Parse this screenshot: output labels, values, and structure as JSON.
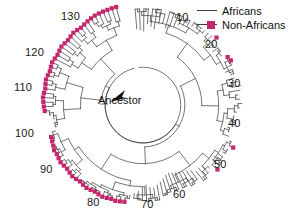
{
  "figure": {
    "type": "radial-phylogenetic-tree",
    "background_color": "#ffffff",
    "branch_color": "#3a3a3a",
    "accent_color": "#c2276b",
    "center_label": "Ancestor"
  },
  "legend": {
    "position": "top-right",
    "items": [
      {
        "label": "Africans",
        "marker": "line",
        "color": "#3a3a3a"
      },
      {
        "label": "Non-Africans",
        "marker": "line-with-square",
        "color": "#c2276b"
      }
    ]
  },
  "axis": {
    "kind": "radial-tip-index",
    "labels": [
      "10",
      "20",
      "30",
      "40",
      "50",
      "60",
      "70",
      "80",
      "90",
      "100",
      "110",
      "120",
      "130"
    ],
    "tip_count": 135,
    "label_positions": [
      {
        "value": "10",
        "x": 176,
        "y": 12
      },
      {
        "value": "20",
        "x": 205,
        "y": 39
      },
      {
        "value": "30",
        "x": 228,
        "y": 78
      },
      {
        "value": "40",
        "x": 228,
        "y": 118
      },
      {
        "value": "50",
        "x": 214,
        "y": 159
      },
      {
        "value": "60",
        "x": 173,
        "y": 189
      },
      {
        "value": "70",
        "x": 141,
        "y": 199
      },
      {
        "value": "80",
        "x": 87,
        "y": 197
      },
      {
        "value": "90",
        "x": 40,
        "y": 164
      },
      {
        "value": "100",
        "x": 15,
        "y": 128
      },
      {
        "value": "110",
        "x": 14,
        "y": 82
      },
      {
        "value": "120",
        "x": 25,
        "y": 47
      },
      {
        "value": "130",
        "x": 61,
        "y": 11
      }
    ]
  },
  "chart_data": {
    "type": "tree",
    "title": "",
    "subtitle": "",
    "xlabel": "",
    "ylabel": "",
    "legend_position": "top-right",
    "grid": false,
    "center": {
      "cx": 143,
      "cy": 105,
      "label": "Ancestor"
    },
    "radial_layout": {
      "inner_radius": 38,
      "outer_radius": 100,
      "start_angle_deg": -96,
      "sweep_deg": 352,
      "direction": "clockwise"
    },
    "series": [
      {
        "name": "Africans",
        "color": "#3a3a3a",
        "marker": "none",
        "tip_count": 106
      },
      {
        "name": "Non-Africans",
        "color": "#c2276b",
        "marker": "square",
        "tip_count": 29
      }
    ],
    "tips": [
      {
        "index": 1,
        "group": "Africans",
        "depth": 0.62
      },
      {
        "index": 2,
        "group": "Africans",
        "depth": 0.6
      },
      {
        "index": 3,
        "group": "Africans",
        "depth": 0.58
      },
      {
        "index": 4,
        "group": "Africans",
        "depth": 0.7
      },
      {
        "index": 5,
        "group": "Africans",
        "depth": 0.66
      },
      {
        "index": 6,
        "group": "Africans",
        "depth": 0.63
      },
      {
        "index": 7,
        "group": "Africans",
        "depth": 0.72
      },
      {
        "index": 8,
        "group": "Africans",
        "depth": 0.74
      },
      {
        "index": 9,
        "group": "Africans",
        "depth": 0.68
      },
      {
        "index": 10,
        "group": "Africans",
        "depth": 0.71
      },
      {
        "index": 11,
        "group": "Africans",
        "depth": 0.75
      },
      {
        "index": 12,
        "group": "Africans",
        "depth": 0.8
      },
      {
        "index": 13,
        "group": "Africans",
        "depth": 0.83
      },
      {
        "index": 14,
        "group": "Africans",
        "depth": 0.85
      },
      {
        "index": 15,
        "group": "Africans",
        "depth": 0.88
      },
      {
        "index": 16,
        "group": "Africans",
        "depth": 0.9
      },
      {
        "index": 17,
        "group": "Africans",
        "depth": 0.92
      },
      {
        "index": 18,
        "group": "Africans",
        "depth": 0.94
      },
      {
        "index": 19,
        "group": "Africans",
        "depth": 0.95
      },
      {
        "index": 20,
        "group": "Africans",
        "depth": 0.96
      },
      {
        "index": 21,
        "group": "Non-Africans",
        "depth": 0.97
      },
      {
        "index": 22,
        "group": "Africans",
        "depth": 0.84
      },
      {
        "index": 23,
        "group": "Africans",
        "depth": 0.8
      },
      {
        "index": 24,
        "group": "Africans",
        "depth": 0.86
      },
      {
        "index": 25,
        "group": "Africans",
        "depth": 0.88
      },
      {
        "index": 26,
        "group": "Non-Africans",
        "depth": 0.93
      },
      {
        "index": 27,
        "group": "Non-Africans",
        "depth": 0.95
      },
      {
        "index": 28,
        "group": "Africans",
        "depth": 0.9
      },
      {
        "index": 29,
        "group": "Africans",
        "depth": 0.82
      },
      {
        "index": 30,
        "group": "Africans",
        "depth": 0.88
      },
      {
        "index": 31,
        "group": "Africans",
        "depth": 0.92
      },
      {
        "index": 32,
        "group": "Africans",
        "depth": 0.96
      },
      {
        "index": 33,
        "group": "Africans",
        "depth": 0.99
      },
      {
        "index": 34,
        "group": "Africans",
        "depth": 0.97
      },
      {
        "index": 35,
        "group": "Africans",
        "depth": 0.93
      },
      {
        "index": 36,
        "group": "Africans",
        "depth": 0.95
      },
      {
        "index": 37,
        "group": "Africans",
        "depth": 0.98
      },
      {
        "index": 38,
        "group": "Africans",
        "depth": 0.94
      },
      {
        "index": 39,
        "group": "Africans",
        "depth": 0.9
      },
      {
        "index": 40,
        "group": "Africans",
        "depth": 0.86
      },
      {
        "index": 41,
        "group": "Africans",
        "depth": 0.88
      },
      {
        "index": 42,
        "group": "Africans",
        "depth": 0.84
      },
      {
        "index": 43,
        "group": "Africans",
        "depth": 0.8
      },
      {
        "index": 44,
        "group": "Africans",
        "depth": 0.83
      },
      {
        "index": 45,
        "group": "Africans",
        "depth": 0.86
      },
      {
        "index": 46,
        "group": "Africans",
        "depth": 0.9
      },
      {
        "index": 47,
        "group": "Non-Africans",
        "depth": 0.97
      },
      {
        "index": 48,
        "group": "Africans",
        "depth": 0.92
      },
      {
        "index": 49,
        "group": "Africans",
        "depth": 0.88
      },
      {
        "index": 50,
        "group": "Africans",
        "depth": 0.84
      },
      {
        "index": 51,
        "group": "Africans",
        "depth": 0.8
      },
      {
        "index": 52,
        "group": "Africans",
        "depth": 0.82
      },
      {
        "index": 53,
        "group": "Non-Africans",
        "depth": 0.95
      },
      {
        "index": 54,
        "group": "Africans",
        "depth": 0.86
      },
      {
        "index": 55,
        "group": "Africans",
        "depth": 0.78
      },
      {
        "index": 56,
        "group": "Africans",
        "depth": 0.74
      },
      {
        "index": 57,
        "group": "Africans",
        "depth": 0.76
      },
      {
        "index": 58,
        "group": "Africans",
        "depth": 0.7
      },
      {
        "index": 59,
        "group": "Africans",
        "depth": 0.66
      },
      {
        "index": 60,
        "group": "Africans",
        "depth": 0.64
      },
      {
        "index": 61,
        "group": "Africans",
        "depth": 0.62
      },
      {
        "index": 62,
        "group": "Africans",
        "depth": 0.6
      },
      {
        "index": 63,
        "group": "Africans",
        "depth": 0.58
      },
      {
        "index": 64,
        "group": "Africans",
        "depth": 0.56
      },
      {
        "index": 65,
        "group": "Africans",
        "depth": 0.58
      },
      {
        "index": 66,
        "group": "Africans",
        "depth": 0.62
      },
      {
        "index": 67,
        "group": "Africans",
        "depth": 0.66
      },
      {
        "index": 68,
        "group": "Africans",
        "depth": 0.7
      },
      {
        "index": 69,
        "group": "Africans",
        "depth": 0.74
      },
      {
        "index": 70,
        "group": "Africans",
        "depth": 0.72
      },
      {
        "index": 71,
        "group": "Africans",
        "depth": 0.68
      },
      {
        "index": 72,
        "group": "Africans",
        "depth": 0.72
      },
      {
        "index": 73,
        "group": "Africans",
        "depth": 0.78
      },
      {
        "index": 74,
        "group": "Africans",
        "depth": 0.82
      },
      {
        "index": 75,
        "group": "Africans",
        "depth": 0.86
      },
      {
        "index": 76,
        "group": "Non-Africans",
        "depth": 0.95
      },
      {
        "index": 77,
        "group": "Non-Africans",
        "depth": 0.96
      },
      {
        "index": 78,
        "group": "Non-Africans",
        "depth": 0.97
      },
      {
        "index": 79,
        "group": "Non-Africans",
        "depth": 0.96
      },
      {
        "index": 80,
        "group": "Non-Africans",
        "depth": 0.97
      },
      {
        "index": 81,
        "group": "Non-Africans",
        "depth": 0.98
      },
      {
        "index": 82,
        "group": "Non-Africans",
        "depth": 0.97
      },
      {
        "index": 83,
        "group": "Non-Africans",
        "depth": 0.96
      },
      {
        "index": 84,
        "group": "Non-Africans",
        "depth": 0.97
      },
      {
        "index": 85,
        "group": "Non-Africans",
        "depth": 0.98
      },
      {
        "index": 86,
        "group": "Non-Africans",
        "depth": 0.97
      },
      {
        "index": 87,
        "group": "Non-Africans",
        "depth": 0.96
      },
      {
        "index": 88,
        "group": "Non-Africans",
        "depth": 0.97
      },
      {
        "index": 89,
        "group": "Non-Africans",
        "depth": 0.98
      },
      {
        "index": 90,
        "group": "Non-Africans",
        "depth": 0.97
      },
      {
        "index": 91,
        "group": "Non-Africans",
        "depth": 0.96
      },
      {
        "index": 92,
        "group": "Non-Africans",
        "depth": 0.97
      },
      {
        "index": 93,
        "group": "Non-Africans",
        "depth": 0.98
      },
      {
        "index": 94,
        "group": "Non-Africans",
        "depth": 0.97
      },
      {
        "index": 95,
        "group": "Non-Africans",
        "depth": 0.96
      },
      {
        "index": 96,
        "group": "Non-Africans",
        "depth": 0.97
      },
      {
        "index": 97,
        "group": "Non-Africans",
        "depth": 0.95
      },
      {
        "index": 98,
        "group": "Non-Africans",
        "depth": 0.94
      },
      {
        "index": 99,
        "group": "Non-Africans",
        "depth": 0.93
      },
      {
        "index": 100,
        "group": "Africans",
        "depth": 0.86
      },
      {
        "index": 101,
        "group": "Africans",
        "depth": 0.82
      },
      {
        "index": 102,
        "group": "Africans",
        "depth": 0.8
      },
      {
        "index": 103,
        "group": "Africans",
        "depth": 0.84
      },
      {
        "index": 104,
        "group": "Africans",
        "depth": 0.88
      },
      {
        "index": 105,
        "group": "Non-Africans",
        "depth": 0.95
      },
      {
        "index": 106,
        "group": "Non-Africans",
        "depth": 0.96
      },
      {
        "index": 107,
        "group": "Non-Africans",
        "depth": 0.97
      },
      {
        "index": 108,
        "group": "Non-Africans",
        "depth": 0.98
      },
      {
        "index": 109,
        "group": "Non-Africans",
        "depth": 0.97
      },
      {
        "index": 110,
        "group": "Non-Africans",
        "depth": 0.96
      },
      {
        "index": 111,
        "group": "Non-Africans",
        "depth": 0.97
      },
      {
        "index": 112,
        "group": "Non-Africans",
        "depth": 0.98
      },
      {
        "index": 113,
        "group": "Non-Africans",
        "depth": 0.97
      },
      {
        "index": 114,
        "group": "Non-Africans",
        "depth": 0.96
      },
      {
        "index": 115,
        "group": "Non-Africans",
        "depth": 0.97
      },
      {
        "index": 116,
        "group": "Non-Africans",
        "depth": 0.98
      },
      {
        "index": 117,
        "group": "Non-Africans",
        "depth": 0.97
      },
      {
        "index": 118,
        "group": "Non-Africans",
        "depth": 0.96
      },
      {
        "index": 119,
        "group": "Non-Africans",
        "depth": 0.97
      },
      {
        "index": 120,
        "group": "Non-Africans",
        "depth": 0.98
      },
      {
        "index": 121,
        "group": "Non-Africans",
        "depth": 0.97
      },
      {
        "index": 122,
        "group": "Non-Africans",
        "depth": 0.96
      },
      {
        "index": 123,
        "group": "Non-Africans",
        "depth": 0.97
      },
      {
        "index": 124,
        "group": "Non-Africans",
        "depth": 0.98
      },
      {
        "index": 125,
        "group": "Non-Africans",
        "depth": 0.97
      },
      {
        "index": 126,
        "group": "Non-Africans",
        "depth": 0.96
      },
      {
        "index": 127,
        "group": "Non-Africans",
        "depth": 0.97
      },
      {
        "index": 128,
        "group": "Non-Africans",
        "depth": 0.98
      },
      {
        "index": 129,
        "group": "Non-Africans",
        "depth": 0.99
      },
      {
        "index": 130,
        "group": "Non-Africans",
        "depth": 1.0
      },
      {
        "index": 131,
        "group": "Non-Africans",
        "depth": 1.0
      },
      {
        "index": 132,
        "group": "Non-Africans",
        "depth": 1.0
      },
      {
        "index": 133,
        "group": "Non-Africans",
        "depth": 1.0
      },
      {
        "index": 134,
        "group": "Non-Africans",
        "depth": 1.0
      },
      {
        "index": 135,
        "group": "Non-Africans",
        "depth": 1.0
      }
    ]
  }
}
